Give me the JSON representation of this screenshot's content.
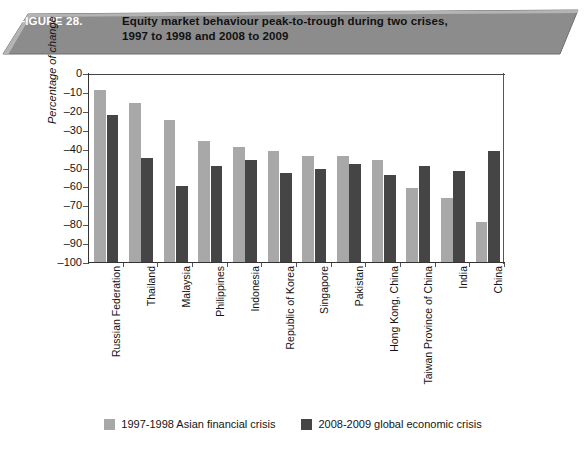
{
  "banner": {
    "figure_label": "FIGURE 28.",
    "title": "Equity market behaviour peak-to-trough during two crises,\n1997 to 1998 and 2008 to 2009",
    "fill_color": "#8c8c8c",
    "label_color": "#ffffff",
    "title_color": "#111111"
  },
  "chart_data": {
    "type": "bar",
    "title": "Equity market behaviour peak-to-trough during two crises, 1997 to 1998 and 2008 to 2009",
    "xlabel": "",
    "ylabel": "Percentage of change",
    "ylim": [
      -100,
      0
    ],
    "yticks": [
      0,
      -10,
      -20,
      -30,
      -40,
      -50,
      -60,
      -70,
      -80,
      -90,
      -100
    ],
    "ytick_labels": [
      "0",
      "–10",
      "–20",
      "–30",
      "–40",
      "–50",
      "–60",
      "–70",
      "–80",
      "–90",
      "–100"
    ],
    "grid": false,
    "legend_position": "bottom",
    "categories": [
      "Russian Federation",
      "Thailand",
      "Malaysia",
      "Philippines",
      "Indonesia",
      "Republic of Korea",
      "Singapore",
      "Pakistan",
      "Hong Kong, China",
      "Taiwan Province of China",
      "India",
      "China"
    ],
    "series": [
      {
        "name": "1997-1998 Asian financial crisis",
        "color": "#a8a8a8",
        "values": [
          -91,
          -84,
          -75,
          -64,
          -61,
          -59,
          -56,
          -56,
          -54,
          -39,
          -34,
          -21
        ]
      },
      {
        "name": "2008-2009 global economic crisis",
        "color": "#454545",
        "values": [
          -78,
          -55,
          -40,
          -51,
          -54,
          -47,
          -49,
          -52,
          -46,
          -51,
          -48,
          -59
        ]
      }
    ]
  },
  "legend": {
    "entries": [
      {
        "label": "1997-1998 Asian financial crisis",
        "color": "#a8a8a8"
      },
      {
        "label": "2008-2009 global economic crisis",
        "color": "#454545"
      }
    ]
  }
}
